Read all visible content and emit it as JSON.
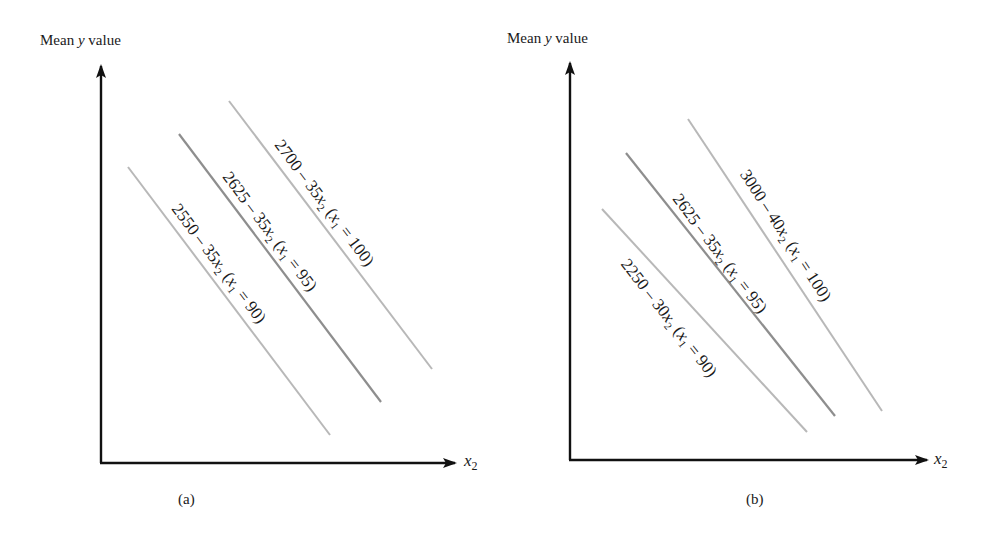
{
  "panels": [
    {
      "id": "a",
      "caption": "(a)",
      "y_axis_label_pre": "Mean ",
      "y_axis_label_var": "y",
      "y_axis_label_post": " value",
      "x_axis_label_var": "x",
      "x_axis_label_sub": "2",
      "lines": [
        {
          "const": "2550",
          "slope": "35",
          "x1_value": "90",
          "color": "#b5b5b5"
        },
        {
          "const": "2625",
          "slope": "35",
          "x1_value": "95",
          "color": "#8c8c8c"
        },
        {
          "const": "2700",
          "slope": "35",
          "x1_value": "100",
          "color": "#b5b5b5"
        }
      ]
    },
    {
      "id": "b",
      "caption": "(b)",
      "y_axis_label_pre": "Mean ",
      "y_axis_label_var": "y",
      "y_axis_label_post": " value",
      "x_axis_label_var": "x",
      "x_axis_label_sub": "2",
      "lines": [
        {
          "const": "2250",
          "slope": "30",
          "x1_value": "90",
          "color": "#b5b5b5"
        },
        {
          "const": "2625",
          "slope": "35",
          "x1_value": "95",
          "color": "#8c8c8c"
        },
        {
          "const": "3000",
          "slope": "40",
          "x1_value": "100",
          "color": "#b5b5b5"
        }
      ]
    }
  ],
  "text": {
    "minus": " – ",
    "x2": "x",
    "x2_sub": "2",
    "paren_open": "  (",
    "x1": "x",
    "x1_sub": "1",
    "equals": " = ",
    "paren_close": ")"
  }
}
